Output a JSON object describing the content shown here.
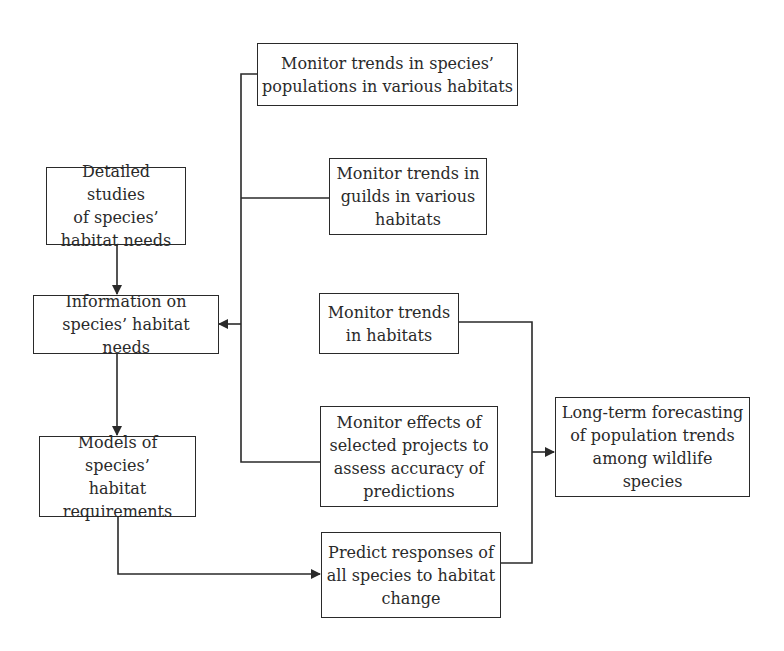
{
  "diagram": {
    "type": "flowchart",
    "nodes": [
      {
        "id": "monitor_species_populations",
        "lines": [
          "Monitor trends in species’",
          "populations in various habitats"
        ]
      },
      {
        "id": "monitor_guilds",
        "lines": [
          "Monitor trends in",
          "guilds in various",
          "habitats"
        ]
      },
      {
        "id": "detailed_studies",
        "lines": [
          "Detailed studies",
          "of species’",
          "habitat needs"
        ]
      },
      {
        "id": "information_habitat_needs",
        "lines": [
          "Information on",
          "species’ habitat needs"
        ]
      },
      {
        "id": "monitor_habitats",
        "lines": [
          "Monitor trends",
          "in habitats"
        ]
      },
      {
        "id": "monitor_effects",
        "lines": [
          "Monitor effects of",
          "selected projects to",
          "assess accuracy of",
          "predictions"
        ]
      },
      {
        "id": "models_habitat_requirements",
        "lines": [
          "Models of species’",
          "habitat",
          "requirements"
        ]
      },
      {
        "id": "long_term_forecasting",
        "lines": [
          "Long-term forecasting",
          "of population trends",
          "among wildlife",
          "species"
        ]
      },
      {
        "id": "predict_responses",
        "lines": [
          "Predict responses of",
          "all species to habitat",
          "change"
        ]
      }
    ],
    "edges": [
      {
        "from": "detailed_studies",
        "to": "information_habitat_needs"
      },
      {
        "from": "monitor_species_populations",
        "to": "information_habitat_needs"
      },
      {
        "from": "monitor_guilds",
        "to": "information_habitat_needs"
      },
      {
        "from": "monitor_effects",
        "to": "information_habitat_needs"
      },
      {
        "from": "information_habitat_needs",
        "to": "models_habitat_requirements"
      },
      {
        "from": "models_habitat_requirements",
        "to": "predict_responses"
      },
      {
        "from": "monitor_habitats",
        "to": "long_term_forecasting"
      },
      {
        "from": "predict_responses",
        "to": "long_term_forecasting"
      }
    ]
  },
  "colors": {
    "line": "#2a2a2a",
    "background": "#ffffff"
  }
}
